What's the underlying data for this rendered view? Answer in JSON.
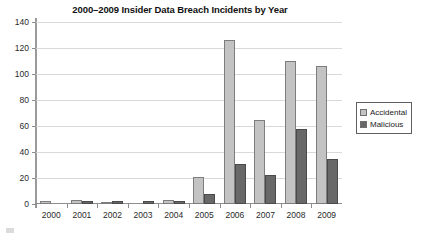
{
  "chart_data": {
    "type": "bar",
    "title": "2000–2009 Insider Data Breach Incidents by Year",
    "xlabel": "",
    "ylabel": "",
    "categories": [
      "2000",
      "2001",
      "2002",
      "2003",
      "2004",
      "2005",
      "2006",
      "2007",
      "2008",
      "2009"
    ],
    "series": [
      {
        "name": "Accidental",
        "color": "#c3c3c3",
        "values": [
          2,
          3,
          1,
          0,
          3,
          21,
          126,
          65,
          110,
          106
        ]
      },
      {
        "name": "Malicious",
        "color": "#686868",
        "values": [
          0,
          2,
          2,
          2,
          2,
          8,
          31,
          22,
          58,
          35
        ]
      }
    ],
    "ylim": [
      0,
      140
    ],
    "yticks": [
      0,
      20,
      40,
      60,
      80,
      100,
      120,
      140
    ],
    "ytick_labels": [
      "0",
      "20",
      "40",
      "60",
      "80",
      "100",
      "120",
      "140"
    ],
    "grid": "horizontal",
    "legend_position": "right"
  },
  "legend": {
    "items": [
      {
        "label": "Accidental",
        "swatch": "accidental-swatch-icon"
      },
      {
        "label": "Malicious",
        "swatch": "malicious-swatch-icon"
      }
    ]
  },
  "colors": {
    "accidental": "#c3c3c3",
    "malicious": "#686868",
    "gridline": "#d9d9d9",
    "axis": "#8e8e8e",
    "text": "#1a1a1a",
    "background": "#ffffff"
  }
}
